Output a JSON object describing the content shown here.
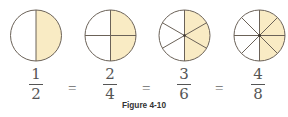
{
  "figure": {
    "caption": "Figure 4-10",
    "colors": {
      "shaded": "#f9ebc4",
      "stroke": "#6b6258",
      "text": "#555555"
    },
    "circles": [
      {
        "parts": 2,
        "shaded": 1
      },
      {
        "parts": 4,
        "shaded": 2
      },
      {
        "parts": 6,
        "shaded": 3
      },
      {
        "parts": 8,
        "shaded": 4
      }
    ],
    "fractions": [
      {
        "numerator": "1",
        "denominator": "2"
      },
      {
        "numerator": "2",
        "denominator": "4"
      },
      {
        "numerator": "3",
        "denominator": "6"
      },
      {
        "numerator": "4",
        "denominator": "8"
      }
    ],
    "equals": [
      "=",
      "=",
      "="
    ]
  }
}
